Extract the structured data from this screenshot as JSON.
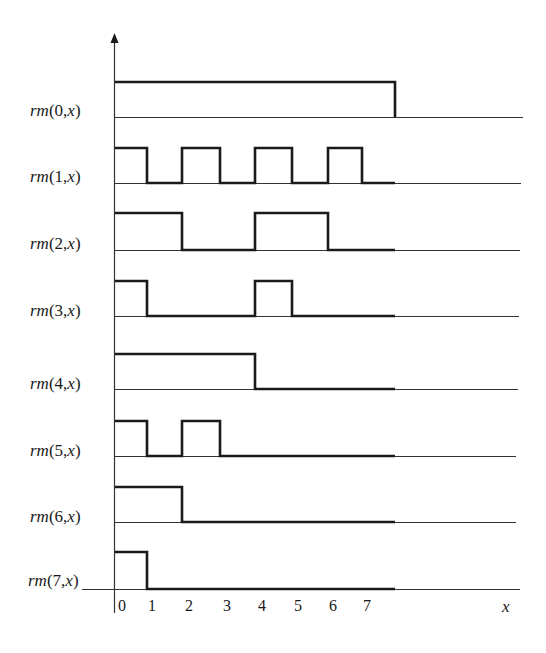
{
  "diagram": {
    "title": "",
    "colors": {
      "signal": "#1a1a1a",
      "baseline": "#333333",
      "text": "#1a1a1a",
      "background": "#ffffff"
    },
    "axis": {
      "x_label": "x",
      "x_ticks": [
        "0",
        "1",
        "2",
        "3",
        "4",
        "5",
        "6",
        "7"
      ],
      "y_axis_arrow": true
    },
    "rows": [
      {
        "label_fn": "rm",
        "label_args": "(0,",
        "label_var": "x",
        "label_close": ")",
        "index": 0,
        "pattern": [
          1,
          1,
          1,
          1,
          1,
          1,
          1,
          1
        ]
      },
      {
        "label_fn": "rm",
        "label_args": "(1,",
        "label_var": "x",
        "label_close": ")",
        "index": 1,
        "pattern": [
          1,
          0,
          1,
          0,
          1,
          0,
          1,
          0
        ]
      },
      {
        "label_fn": "rm",
        "label_args": "(2,",
        "label_var": "x",
        "label_close": ")",
        "index": 2,
        "pattern": [
          1,
          1,
          0,
          0,
          1,
          1,
          0,
          0
        ]
      },
      {
        "label_fn": "rm",
        "label_args": "(3,",
        "label_var": "x",
        "label_close": ")",
        "index": 3,
        "pattern": [
          1,
          0,
          0,
          0,
          1,
          0,
          0,
          0
        ]
      },
      {
        "label_fn": "rm",
        "label_args": "(4,",
        "label_var": "x",
        "label_close": ")",
        "index": 4,
        "pattern": [
          1,
          1,
          1,
          1,
          0,
          0,
          0,
          0
        ]
      },
      {
        "label_fn": "rm",
        "label_args": "(5,",
        "label_var": "x",
        "label_close": ")",
        "index": 5,
        "pattern": [
          1,
          0,
          1,
          0,
          0,
          0,
          0,
          0
        ]
      },
      {
        "label_fn": "rm",
        "label_args": "(6,",
        "label_var": "x",
        "label_close": ")",
        "index": 6,
        "pattern": [
          1,
          1,
          0,
          0,
          0,
          0,
          0,
          0
        ]
      },
      {
        "label_fn": "rm",
        "label_args": "(7,",
        "label_var": "x",
        "label_close": ")",
        "index": 7,
        "pattern": [
          1,
          0,
          0,
          0,
          0,
          0,
          0,
          0
        ]
      }
    ]
  }
}
